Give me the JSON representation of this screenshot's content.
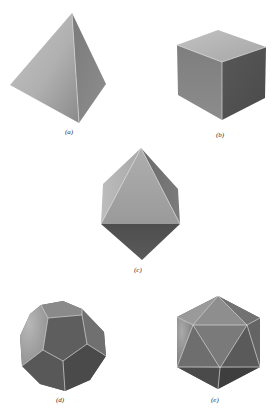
{
  "figure": {
    "header_fragment": "",
    "solids": [
      {
        "id": "a",
        "name": "tetrahedron",
        "label": "(a)"
      },
      {
        "id": "b",
        "name": "cube",
        "label": "(b)"
      },
      {
        "id": "c",
        "name": "octahedron",
        "label": "(c)"
      },
      {
        "id": "d",
        "name": "dodecahedron",
        "label": "(d)"
      },
      {
        "id": "e",
        "name": "icosahedron",
        "label": "(e)"
      }
    ]
  },
  "colors": {
    "background": "#ffffff",
    "face_light": "#b4b4b4",
    "face_mid": "#8c8c8c",
    "face_dark": "#555555",
    "edge": "#d8d8d8",
    "label": "#333333"
  }
}
